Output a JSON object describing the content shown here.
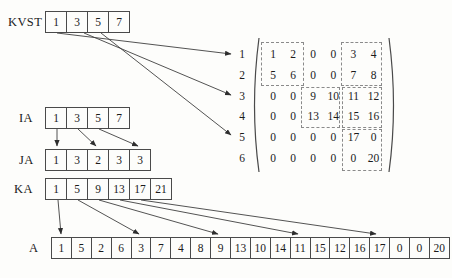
{
  "labels": {
    "kvst": "KVST",
    "ia": "IA",
    "ja": "JA",
    "ka": "KA",
    "a": "A"
  },
  "arrays": {
    "kvst": [
      "1",
      "3",
      "5",
      "7"
    ],
    "ia": [
      "1",
      "3",
      "5",
      "7"
    ],
    "ja": [
      "1",
      "3",
      "2",
      "3",
      "3"
    ],
    "ka": [
      "1",
      "5",
      "9",
      "13",
      "17",
      "21"
    ],
    "a": [
      "1",
      "5",
      "2",
      "6",
      "3",
      "7",
      "4",
      "8",
      "9",
      "13",
      "10",
      "14",
      "11",
      "15",
      "12",
      "16",
      "17",
      "0",
      "0",
      "20"
    ]
  },
  "matrix": {
    "n_rows": 6,
    "n_cols": 6,
    "row_labels": [
      "1",
      "2",
      "3",
      "4",
      "5",
      "6"
    ],
    "rows": [
      [
        "1",
        "2",
        "0",
        "0",
        "3",
        "4"
      ],
      [
        "5",
        "6",
        "0",
        "0",
        "7",
        "8"
      ],
      [
        "0",
        "0",
        "9",
        "10",
        "11",
        "12"
      ],
      [
        "0",
        "0",
        "13",
        "14",
        "15",
        "16"
      ],
      [
        "0",
        "0",
        "0",
        "0",
        "17",
        "0"
      ],
      [
        "0",
        "0",
        "0",
        "0",
        "0",
        "20"
      ]
    ],
    "cells": [
      "1",
      "2",
      "0",
      "0",
      "3",
      "4",
      "5",
      "6",
      "0",
      "0",
      "7",
      "8",
      "0",
      "0",
      "9",
      "10",
      "11",
      "12",
      "0",
      "0",
      "13",
      "14",
      "15",
      "16",
      "0",
      "0",
      "0",
      "0",
      "17",
      "0",
      "0",
      "0",
      "0",
      "0",
      "0",
      "20"
    ],
    "dashed_blocks": [
      {
        "rows": "1-2",
        "cols": "1-2"
      },
      {
        "rows": "1-2",
        "cols": "5-6"
      },
      {
        "rows": "3-4",
        "cols": "3-4"
      },
      {
        "rows": "3-4",
        "cols": "5-6"
      },
      {
        "rows": "5-6",
        "cols": "5-6"
      }
    ]
  },
  "connections": {
    "kvst_to_matrix_rows": [
      "1",
      "3",
      "5"
    ],
    "ia_to_ja_positions": [
      "1",
      "3",
      "5"
    ],
    "ka_to_a_positions": [
      "1",
      "5",
      "9",
      "13",
      "17"
    ]
  },
  "colors": {
    "line": "#3f3f3f",
    "text": "#1b1b1b",
    "dash": "#8a8a8a",
    "background": "#fdfdfb"
  }
}
